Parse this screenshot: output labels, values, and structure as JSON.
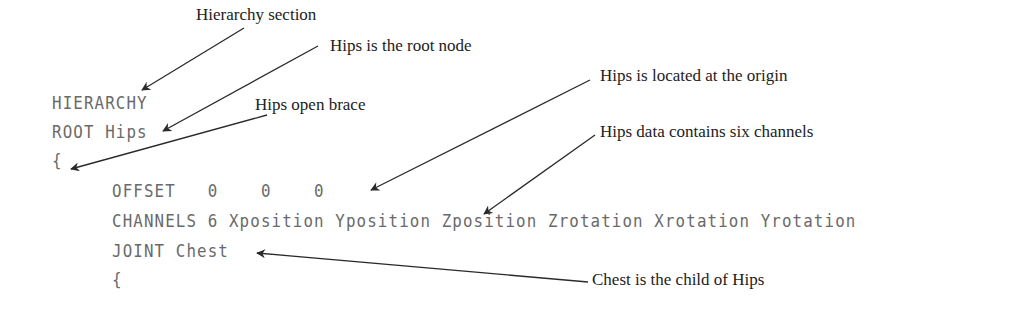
{
  "code_lines": [
    {
      "text": "HIERARCHY",
      "indent": 0
    },
    {
      "text": "ROOT Hips",
      "indent": 0
    },
    {
      "text": "{",
      "indent": 0
    },
    {
      "text": "OFFSET   0    0    0",
      "indent": 1
    },
    {
      "text": "CHANNELS 6 Xposition Yposition Zposition Zrotation Xrotation Yrotation",
      "indent": 1
    },
    {
      "text": "JOINT Chest",
      "indent": 1
    },
    {
      "text": "{",
      "indent": 1
    }
  ],
  "annotations": [
    {
      "text": "Hierarchy section",
      "points_to": "HIERARCHY"
    },
    {
      "text": "Hips is the root node",
      "points_to": "ROOT Hips"
    },
    {
      "text": "Hips open brace",
      "points_to": "{"
    },
    {
      "text": "Hips is located at the origin",
      "points_to": "OFFSET 0 0 0"
    },
    {
      "text": "Hips data contains six channels",
      "points_to": "CHANNELS 6"
    },
    {
      "text": "Chest is the child of Hips",
      "points_to": "JOINT Chest"
    }
  ],
  "colors": {
    "code": "#6a6a6a",
    "label": "#222222",
    "arrow": "#2a2a2a"
  }
}
